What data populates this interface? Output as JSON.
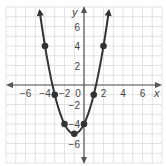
{
  "chart_data": {
    "type": "line",
    "title": "",
    "xlabel": "x",
    "ylabel": "y",
    "xlim": [
      -8,
      8
    ],
    "ylim": [
      -8,
      8
    ],
    "grid": true,
    "grid_step": 1,
    "x_ticks": [
      -6,
      -4,
      -2,
      0,
      2,
      4,
      6
    ],
    "x_tick_labels": [
      "−6",
      "−4",
      "−2",
      "0",
      "2",
      "4",
      "6"
    ],
    "y_ticks": [
      -6,
      -4,
      -2,
      2,
      4,
      6
    ],
    "y_tick_labels": [
      "−6",
      "−4",
      "−2",
      "2",
      "4",
      "6"
    ],
    "function": "y = x^2 + 2x - 4",
    "series": [
      {
        "name": "parabola",
        "x": [
          -4,
          -3,
          -2,
          -1,
          0,
          1,
          2
        ],
        "y": [
          4,
          -1,
          -4,
          -5,
          -4,
          -1,
          4
        ],
        "markers": true,
        "curve_arrows": true
      }
    ],
    "colors": {
      "grid": "#dcdcdc",
      "axis": "#555555",
      "curve": "#333333",
      "marker": "#333333"
    }
  }
}
